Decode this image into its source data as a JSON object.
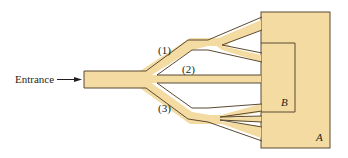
{
  "diagram": {
    "entrance_label": "Entrance",
    "branch_labels": [
      "(1)",
      "(2)",
      "(3)"
    ],
    "region_labels": {
      "outer": "A",
      "inner": "B"
    },
    "colors": {
      "fill": "#f3dba1",
      "stroke": "#5b4a32",
      "text": "#231f20",
      "background": "#ffffff"
    }
  }
}
